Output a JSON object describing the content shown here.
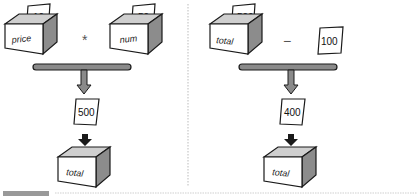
{
  "left_panel": {
    "operand_a": {
      "box_label": "price",
      "value": "10"
    },
    "operator": "*",
    "operand_b": {
      "box_label": "num",
      "value": "50"
    },
    "result_value": "500",
    "target_box_label": "total"
  },
  "right_panel": {
    "operand_a": {
      "box_label": "total",
      "value": "500"
    },
    "operator": "−",
    "operand_b": {
      "value": "100"
    },
    "result_value": "400",
    "target_box_label": "total"
  },
  "colors": {
    "stroke": "#1a1a1a",
    "box_front": "#ffffff",
    "box_side": "#8c8c8c",
    "box_inner": "#c8c8c8",
    "bar_fill": "#8a8a8a",
    "divider": "#bbbbbb"
  }
}
